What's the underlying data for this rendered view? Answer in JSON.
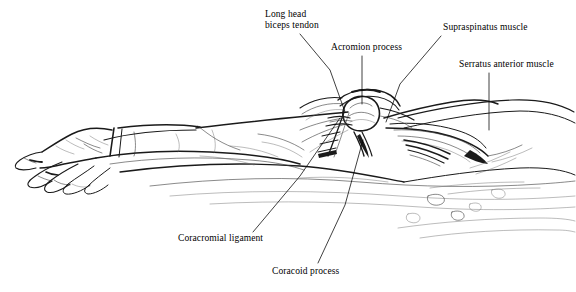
{
  "figure": {
    "background_color": "#ffffff",
    "ink_color": "#1a1a1a",
    "style": "pen-and-ink line drawing"
  },
  "labels": [
    {
      "id": "long-head-biceps-tendon",
      "line1": "Long head",
      "line2": "biceps tendon",
      "x": 265,
      "y": 9,
      "leader": "M 300 34 L 330 70 L 345 112"
    },
    {
      "id": "acromion-process",
      "line1": "Acromion process",
      "line2": "",
      "x": 331,
      "y": 42,
      "leader": "M 362 56 L 362 104"
    },
    {
      "id": "supraspinatus-muscle",
      "line1": "Supraspinatus muscle",
      "line2": "",
      "x": 443,
      "y": 22,
      "leader": "M 441 36 L 400 84 L 386 122"
    },
    {
      "id": "serratus-anterior-muscle",
      "line1": "Serratus anterior muscle",
      "line2": "",
      "x": 459,
      "y": 59,
      "leader": "M 489 73 L 489 130"
    },
    {
      "id": "coracromial-ligament",
      "line1": "Coracromial ligament",
      "line2": "",
      "x": 178,
      "y": 233,
      "leader": "M 253 232 L 300 176 L 340 118"
    },
    {
      "id": "coracoid-process",
      "line1": "Coracoid process",
      "line2": "",
      "x": 272,
      "y": 266,
      "leader": "M 318 263 L 345 205 L 363 140"
    }
  ]
}
